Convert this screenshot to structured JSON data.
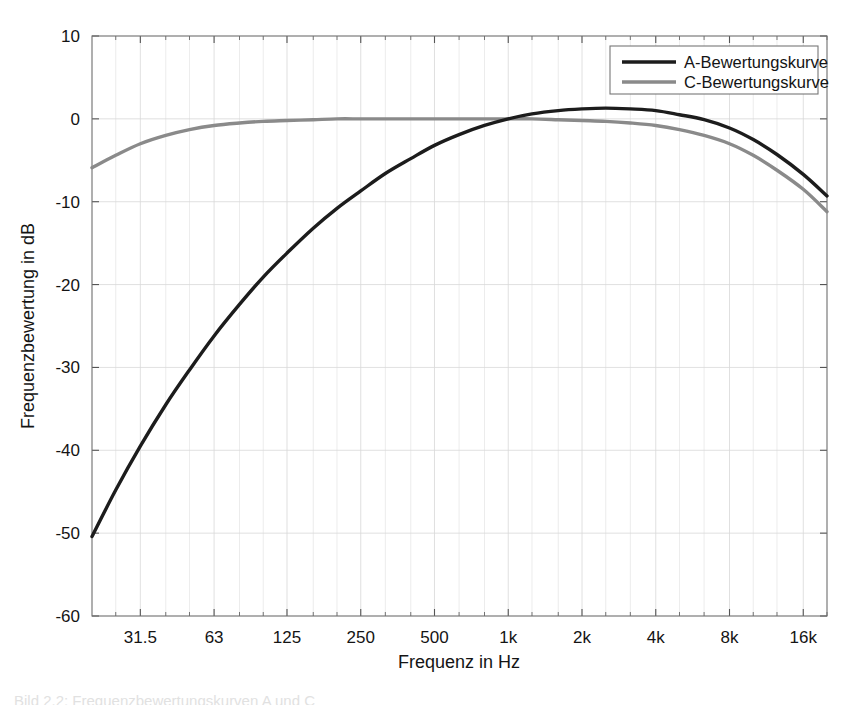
{
  "chart_data": {
    "type": "line",
    "title": "",
    "xlabel": "Frequenz in Hz",
    "ylabel": "Frequenzbewertung in dB",
    "xscale": "log",
    "xlim": [
      20,
      20000
    ],
    "ylim": [
      -60,
      10
    ],
    "grid": true,
    "legend_position": "top-right",
    "xticks": [
      {
        "value": 31.5,
        "label": "31.5"
      },
      {
        "value": 63,
        "label": "63"
      },
      {
        "value": 125,
        "label": "125"
      },
      {
        "value": 250,
        "label": "250"
      },
      {
        "value": 500,
        "label": "500"
      },
      {
        "value": 1000,
        "label": "1k"
      },
      {
        "value": 2000,
        "label": "2k"
      },
      {
        "value": 4000,
        "label": "4k"
      },
      {
        "value": 8000,
        "label": "8k"
      },
      {
        "value": 16000,
        "label": "16k"
      }
    ],
    "xminor_ticks": [
      25,
      40,
      50,
      80,
      100,
      160,
      200,
      315,
      400,
      630,
      800,
      1250,
      1600,
      2500,
      3150,
      5000,
      6300,
      10000,
      12500,
      20000
    ],
    "yticks": [
      {
        "value": 10,
        "label": "10"
      },
      {
        "value": 0,
        "label": "0"
      },
      {
        "value": -10,
        "label": "-10"
      },
      {
        "value": -20,
        "label": "-20"
      },
      {
        "value": -30,
        "label": "-30"
      },
      {
        "value": -40,
        "label": "-40"
      },
      {
        "value": -50,
        "label": "-50"
      },
      {
        "value": -60,
        "label": "-60"
      }
    ],
    "series": [
      {
        "name": "A-Bewertungskurve",
        "color": "#1c1c1c",
        "x": [
          20,
          25,
          31.5,
          40,
          50,
          63,
          80,
          100,
          125,
          160,
          200,
          250,
          315,
          400,
          500,
          630,
          800,
          1000,
          1250,
          1600,
          2000,
          2500,
          3150,
          4000,
          5000,
          6300,
          8000,
          10000,
          12500,
          16000,
          20000
        ],
        "values": [
          -50.4,
          -44.8,
          -39.5,
          -34.5,
          -30.3,
          -26.2,
          -22.4,
          -19.1,
          -16.2,
          -13.2,
          -10.8,
          -8.7,
          -6.6,
          -4.8,
          -3.2,
          -1.9,
          -0.8,
          0.0,
          0.6,
          1.0,
          1.2,
          1.3,
          1.2,
          1.0,
          0.5,
          -0.1,
          -1.1,
          -2.5,
          -4.3,
          -6.7,
          -9.3
        ]
      },
      {
        "name": "C-Bewertungskurve",
        "color": "#8a8a8a",
        "x": [
          20,
          25,
          31.5,
          40,
          50,
          63,
          80,
          100,
          125,
          160,
          200,
          250,
          315,
          400,
          500,
          630,
          800,
          1000,
          1250,
          1600,
          2000,
          2500,
          3150,
          4000,
          5000,
          6300,
          8000,
          10000,
          12500,
          16000,
          20000
        ],
        "values": [
          -5.9,
          -4.4,
          -3.0,
          -2.0,
          -1.3,
          -0.8,
          -0.5,
          -0.3,
          -0.2,
          -0.1,
          0.0,
          0.0,
          0.0,
          0.0,
          0.0,
          0.0,
          0.0,
          0.0,
          0.0,
          -0.1,
          -0.2,
          -0.3,
          -0.5,
          -0.8,
          -1.3,
          -2.0,
          -3.0,
          -4.4,
          -6.2,
          -8.5,
          -11.2
        ]
      }
    ]
  },
  "legend": {
    "entries": [
      {
        "label": "A-Bewertungskurve",
        "color": "#1c1c1c"
      },
      {
        "label": "C-Bewertungskurve",
        "color": "#8a8a8a"
      }
    ]
  },
  "axes": {
    "x_title": "Frequenz in Hz",
    "y_title": "Frequenzbewertung in dB"
  },
  "caption": {
    "fragment": "Bild 2.2: Frequenzbewertungskurven A und C"
  }
}
